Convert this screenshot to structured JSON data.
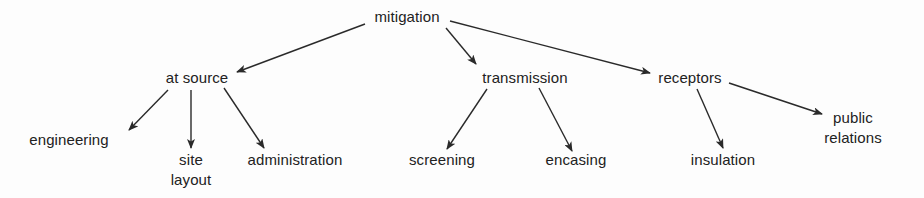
{
  "diagram": {
    "type": "tree",
    "root": "mitigation",
    "line_color": "#2a2a2a",
    "text_color": "#222222",
    "nodes": {
      "mitigation": {
        "label": "mitigation"
      },
      "at_source": {
        "label": "at source"
      },
      "transmission": {
        "label": "transmission"
      },
      "receptors": {
        "label": "receptors"
      },
      "engineering": {
        "label": "engineering"
      },
      "site_layout": {
        "line1": "site",
        "line2": "layout"
      },
      "administration": {
        "label": "administration"
      },
      "screening": {
        "label": "screening"
      },
      "encasing": {
        "label": "encasing"
      },
      "insulation": {
        "label": "insulation"
      },
      "public_relations": {
        "line1": "public",
        "line2": "relations"
      }
    },
    "edges": [
      {
        "from": "mitigation",
        "to": "at source"
      },
      {
        "from": "mitigation",
        "to": "transmission"
      },
      {
        "from": "mitigation",
        "to": "receptors"
      },
      {
        "from": "at source",
        "to": "engineering"
      },
      {
        "from": "at source",
        "to": "site layout"
      },
      {
        "from": "at source",
        "to": "administration"
      },
      {
        "from": "transmission",
        "to": "screening"
      },
      {
        "from": "transmission",
        "to": "encasing"
      },
      {
        "from": "receptors",
        "to": "insulation"
      },
      {
        "from": "receptors",
        "to": "public relations"
      }
    ]
  }
}
